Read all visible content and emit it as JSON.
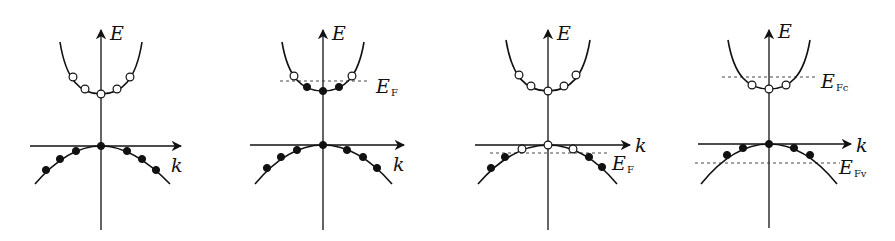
{
  "figure": {
    "axis_labels": {
      "energy": "E",
      "wavevector": "k"
    },
    "panels": [
      {
        "id": "intrinsic",
        "ox": 101,
        "oy": 146,
        "cond_min_y": 94,
        "cond_curve": "M60,42 C66,80 80,94 101,94 C122,94 136,80 142,42",
        "val_curve": "M35,184 C60,155 82,146 101,146 C120,146 142,155 170,184",
        "axis": {
          "v_top": 30,
          "v_bottom": 230,
          "h_left": 30,
          "h_right": 181
        },
        "cond_dots": [
          {
            "x": 73,
            "y": 77,
            "filled": false
          },
          {
            "x": 85,
            "y": 89,
            "filled": false
          },
          {
            "x": 101,
            "y": 94,
            "filled": false
          },
          {
            "x": 117,
            "y": 89,
            "filled": false
          },
          {
            "x": 130,
            "y": 77,
            "filled": false
          }
        ],
        "val_dots": [
          {
            "x": 46,
            "y": 170,
            "filled": true
          },
          {
            "x": 60,
            "y": 159,
            "filled": true
          },
          {
            "x": 76,
            "y": 151,
            "filled": true
          },
          {
            "x": 101,
            "y": 146,
            "filled": true
          },
          {
            "x": 127,
            "y": 151,
            "filled": true
          },
          {
            "x": 142,
            "y": 159,
            "filled": true
          },
          {
            "x": 156,
            "y": 170,
            "filled": true
          }
        ],
        "E_label": {
          "x": 110,
          "y": 40
        },
        "k_label": {
          "x": 171,
          "y": 172
        },
        "fermi_levels": []
      },
      {
        "id": "n-type",
        "ox": 323,
        "oy": 145,
        "cond_curve": "M282,42 C288,78 302,91 323,91 C344,91 358,78 364,42",
        "val_curve": "M255,184 C280,154 303,145 323,145 C343,145 366,154 392,184",
        "axis": {
          "v_top": 30,
          "v_bottom": 230,
          "h_left": 250,
          "h_right": 404
        },
        "cond_dots": [
          {
            "x": 294,
            "y": 76,
            "filled": false
          },
          {
            "x": 307,
            "y": 87,
            "filled": true
          },
          {
            "x": 323,
            "y": 91,
            "filled": true
          },
          {
            "x": 339,
            "y": 87,
            "filled": true
          },
          {
            "x": 352,
            "y": 76,
            "filled": false
          }
        ],
        "val_dots": [
          {
            "x": 267,
            "y": 168,
            "filled": true
          },
          {
            "x": 281,
            "y": 157,
            "filled": true
          },
          {
            "x": 297,
            "y": 150,
            "filled": true
          },
          {
            "x": 323,
            "y": 145,
            "filled": true
          },
          {
            "x": 347,
            "y": 150,
            "filled": true
          },
          {
            "x": 363,
            "y": 157,
            "filled": true
          },
          {
            "x": 377,
            "y": 168,
            "filled": true
          }
        ],
        "E_label": {
          "x": 332,
          "y": 40
        },
        "k_label": {
          "x": 393,
          "y": 171
        },
        "fermi_levels": [
          {
            "label": "E",
            "sub": "F",
            "y": 81,
            "x1": 280,
            "x2": 368,
            "lx": 376,
            "ly": 93
          }
        ]
      },
      {
        "id": "p-type",
        "ox": 548,
        "oy": 145,
        "cond_curve": "M506,40 C512,77 526,91 548,91 C570,91 584,77 590,40",
        "val_curve": "M478,184 C504,154 528,145 548,145 C568,145 592,154 617,184",
        "axis": {
          "v_top": 30,
          "v_bottom": 230,
          "h_left": 475,
          "h_right": 630
        },
        "cond_dots": [
          {
            "x": 519,
            "y": 75,
            "filled": false
          },
          {
            "x": 531,
            "y": 86,
            "filled": false
          },
          {
            "x": 548,
            "y": 91,
            "filled": false
          },
          {
            "x": 564,
            "y": 86,
            "filled": false
          },
          {
            "x": 576,
            "y": 75,
            "filled": false
          }
        ],
        "val_dots": [
          {
            "x": 491,
            "y": 168,
            "filled": true
          },
          {
            "x": 505,
            "y": 157,
            "filled": true
          },
          {
            "x": 522,
            "y": 149,
            "filled": false
          },
          {
            "x": 548,
            "y": 145,
            "filled": false
          },
          {
            "x": 573,
            "y": 149,
            "filled": false
          },
          {
            "x": 589,
            "y": 157,
            "filled": true
          },
          {
            "x": 602,
            "y": 167,
            "filled": true
          }
        ],
        "E_label": {
          "x": 557,
          "y": 40
        },
        "k_label": {
          "x": 635,
          "y": 152
        },
        "fermi_levels": [
          {
            "label": "E",
            "sub": "F",
            "y": 153,
            "x1": 490,
            "x2": 607,
            "lx": 612,
            "ly": 170
          }
        ]
      },
      {
        "id": "quasi-fermi",
        "ox": 769,
        "oy": 144,
        "cond_curve": "M728,40 C734,76 748,89 769,89 C790,89 804,76 810,40",
        "val_curve": "M701,184 C726,153 749,144 769,144 C789,144 812,153 837,184",
        "axis": {
          "v_top": 30,
          "v_bottom": 228,
          "h_left": 698,
          "h_right": 851
        },
        "cond_dots": [
          {
            "x": 752,
            "y": 85,
            "filled": false
          },
          {
            "x": 769,
            "y": 89,
            "filled": false
          },
          {
            "x": 786,
            "y": 85,
            "filled": false
          }
        ],
        "val_dots": [
          {
            "x": 727,
            "y": 155,
            "filled": true
          },
          {
            "x": 743,
            "y": 148,
            "filled": true
          },
          {
            "x": 769,
            "y": 144,
            "filled": true
          },
          {
            "x": 794,
            "y": 148,
            "filled": true
          },
          {
            "x": 810,
            "y": 155,
            "filled": true
          }
        ],
        "E_label": {
          "x": 778,
          "y": 38
        },
        "k_label": {
          "x": 856,
          "y": 152
        },
        "fermi_levels": [
          {
            "label": "E",
            "sub": "Fc",
            "y": 77,
            "x1": 722,
            "x2": 815,
            "lx": 821,
            "ly": 88
          },
          {
            "label": "E",
            "sub": "Fv",
            "y": 163,
            "x1": 695,
            "x2": 840,
            "lx": 839,
            "ly": 174
          }
        ]
      }
    ]
  }
}
